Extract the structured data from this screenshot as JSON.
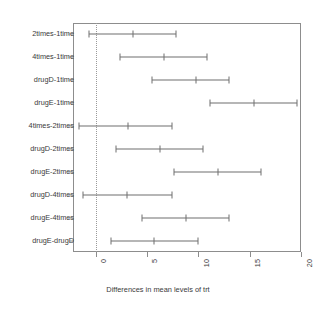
{
  "chart_data": {
    "type": "scatter",
    "subtype": "confidence-interval-dotplot",
    "title": "",
    "xlabel": "Differences in mean levels of trt",
    "ylabel": "",
    "xlim": [
      -2.2,
      20.0
    ],
    "xticks": [
      0,
      5,
      10,
      15,
      20
    ],
    "xticklabels": [
      "0",
      "5",
      "10",
      "15",
      "20"
    ],
    "grid": false,
    "reference_line": 0,
    "categories": [
      "2times-1time",
      "4times-1time",
      "drugD-1time",
      "drugE-1time",
      "4times-2times",
      "drugD-2times",
      "drugE-2times",
      "drugD-4times",
      "drugE-4times",
      "drugE-drugD"
    ],
    "series": [
      {
        "name": "diff",
        "values": [
          3.6,
          6.7,
          9.8,
          15.4,
          3.2,
          6.3,
          11.9,
          3.1,
          8.8,
          5.7
        ]
      },
      {
        "name": "lwr",
        "values": [
          -0.6,
          2.4,
          5.5,
          11.1,
          -1.6,
          2.0,
          7.6,
          -1.2,
          4.5,
          1.5
        ]
      },
      {
        "name": "upr",
        "values": [
          7.8,
          10.8,
          13.0,
          19.6,
          7.4,
          10.5,
          16.1,
          7.4,
          13.0,
          10.0
        ]
      }
    ],
    "points": [
      {
        "label": "2times-1time",
        "lwr": -0.6,
        "diff": 3.6,
        "upr": 7.8
      },
      {
        "label": "4times-1time",
        "lwr": 2.4,
        "diff": 6.7,
        "upr": 10.8
      },
      {
        "label": "drugD-1time",
        "lwr": 5.5,
        "diff": 9.8,
        "upr": 13.0
      },
      {
        "label": "drugE-1time",
        "lwr": 11.1,
        "diff": 15.4,
        "upr": 19.6
      },
      {
        "label": "4times-2times",
        "lwr": -1.6,
        "diff": 3.2,
        "upr": 7.4
      },
      {
        "label": "drugD-2times",
        "lwr": 2.0,
        "diff": 6.3,
        "upr": 10.5
      },
      {
        "label": "drugE-2times",
        "lwr": 7.6,
        "diff": 11.9,
        "upr": 16.1
      },
      {
        "label": "drugD-4times",
        "lwr": -1.2,
        "diff": 3.1,
        "upr": 7.4
      },
      {
        "label": "drugE-4times",
        "lwr": 4.5,
        "diff": 8.8,
        "upr": 13.0
      },
      {
        "label": "drugE-drugD",
        "lwr": 1.5,
        "diff": 5.7,
        "upr": 10.0
      }
    ],
    "colors": {
      "line": "#6f6f6f",
      "axis": "#8d8d8d",
      "reference": "#9a9a9a",
      "text": "#3a3a3a",
      "background": "#ffffff"
    }
  }
}
